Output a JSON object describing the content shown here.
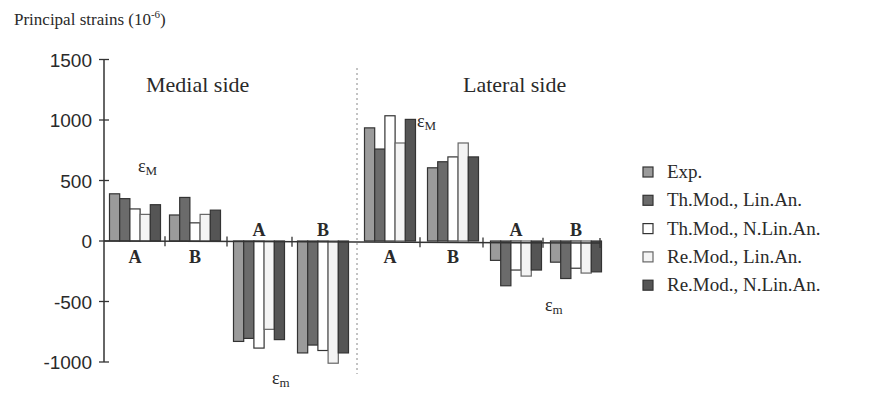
{
  "chart_data": {
    "type": "bar",
    "title": "",
    "ylabel": "Principal strains (10⁻⁶)",
    "xlabel": "",
    "ylim": [
      -1000,
      1500
    ],
    "yticks": [
      1500,
      1000,
      500,
      0,
      -500,
      -1000
    ],
    "grid": false,
    "legend_position": "right",
    "sections": [
      {
        "title": "Medial side",
        "annotations": [
          "εM",
          "εm"
        ]
      },
      {
        "title": "Lateral side",
        "annotations": [
          "εM",
          "εm"
        ]
      }
    ],
    "categories": [
      "Medial εM A",
      "Medial εM B",
      "Medial εm A",
      "Medial εm B",
      "Lateral εM A",
      "Lateral εM B",
      "Lateral εm A",
      "Lateral εm B"
    ],
    "category_short_labels": [
      "A",
      "B",
      "A",
      "B",
      "A",
      "B",
      "A",
      "B"
    ],
    "series": [
      {
        "name": "Exp.",
        "color": "#9b9b9b",
        "values": [
          390,
          215,
          -830,
          -925,
          935,
          605,
          -160,
          -175
        ]
      },
      {
        "name": "Th.Mod., Lin.An.",
        "color": "#6b6b6b",
        "values": [
          350,
          360,
          -805,
          -860,
          760,
          655,
          -370,
          -310
        ]
      },
      {
        "name": "Th.Mod., N.Lin.An.",
        "color": "#ffffff",
        "values": [
          265,
          150,
          -885,
          -905,
          1035,
          695,
          -240,
          -225
        ]
      },
      {
        "name": "Re.Mod., Lin.An.",
        "color": "#f4f4f4",
        "values": [
          220,
          220,
          -730,
          -1010,
          810,
          810,
          -290,
          -265
        ]
      },
      {
        "name": "Re.Mod., N.Lin.An.",
        "color": "#555555",
        "values": [
          300,
          255,
          -815,
          -925,
          1005,
          695,
          -240,
          -255
        ]
      }
    ]
  },
  "labels": {
    "ylabel": "Principal strains (10",
    "ylabel_exp": "-6",
    "ylabel_close": ")",
    "medial": "Medial side",
    "lateral": "Lateral side",
    "eps": "ε",
    "sub_M": "M",
    "sub_m": "m"
  }
}
